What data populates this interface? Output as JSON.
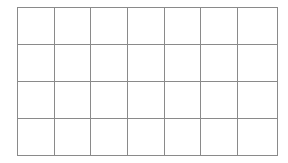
{
  "grid": {
    "columns": 7,
    "rows": 4,
    "line_color": "#8a8a8a",
    "cell_fill": "#ffffff",
    "background": "#ffffff",
    "cells": [
      [
        "",
        "",
        "",
        "",
        "",
        "",
        ""
      ],
      [
        "",
        "",
        "",
        "",
        "",
        "",
        ""
      ],
      [
        "",
        "",
        "",
        "",
        "",
        "",
        ""
      ],
      [
        "",
        "",
        "",
        "",
        "",
        "",
        ""
      ]
    ]
  }
}
